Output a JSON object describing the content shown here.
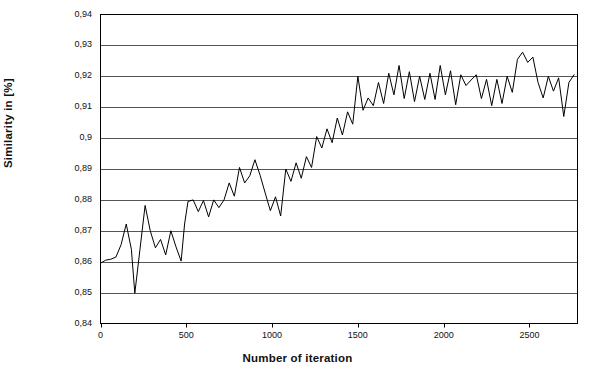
{
  "chart_data": {
    "type": "line",
    "title": "",
    "xlabel": "Number of iteration",
    "ylabel": "Similarity in [%]",
    "xlim": [
      0,
      2780
    ],
    "ylim": [
      0.84,
      0.94
    ],
    "grid": "horizontal",
    "legend": "none",
    "line_color": "#000000",
    "y_tick_labels": [
      "0,94",
      "0,93",
      "0,92",
      "0,91",
      "0,9",
      "0,89",
      "0,88",
      "0,87",
      "0,86",
      "0,85",
      "0,84"
    ],
    "y_tick_values": [
      0.94,
      0.93,
      0.92,
      0.91,
      0.9,
      0.89,
      0.88,
      0.87,
      0.86,
      0.85,
      0.84
    ],
    "x_tick_labels": [
      "0",
      "500",
      "1000",
      "1500",
      "2000",
      "2500"
    ],
    "x_tick_values": [
      0,
      500,
      1000,
      1500,
      2000,
      2500
    ],
    "series": [
      {
        "name": "similarity",
        "x": [
          0,
          30,
          60,
          90,
          120,
          150,
          180,
          200,
          230,
          260,
          290,
          320,
          350,
          380,
          410,
          440,
          470,
          490,
          510,
          540,
          570,
          600,
          630,
          660,
          690,
          720,
          750,
          780,
          810,
          840,
          870,
          900,
          930,
          960,
          990,
          1020,
          1050,
          1080,
          1110,
          1140,
          1170,
          1200,
          1230,
          1260,
          1290,
          1320,
          1350,
          1380,
          1410,
          1440,
          1470,
          1500,
          1530,
          1560,
          1590,
          1620,
          1650,
          1680,
          1710,
          1740,
          1770,
          1800,
          1830,
          1860,
          1890,
          1920,
          1950,
          1980,
          2010,
          2040,
          2070,
          2100,
          2130,
          2160,
          2190,
          2220,
          2250,
          2280,
          2310,
          2340,
          2370,
          2400,
          2430,
          2460,
          2490,
          2520,
          2550,
          2580,
          2610,
          2640,
          2670,
          2700,
          2730,
          2760
        ],
        "y": [
          0.8595,
          0.8605,
          0.8608,
          0.8615,
          0.8655,
          0.8722,
          0.864,
          0.8498,
          0.864,
          0.8782,
          0.87,
          0.8645,
          0.8672,
          0.8622,
          0.87,
          0.8648,
          0.8602,
          0.8722,
          0.8795,
          0.88,
          0.8762,
          0.8798,
          0.8745,
          0.88,
          0.8775,
          0.88,
          0.8855,
          0.8812,
          0.8905,
          0.8855,
          0.8878,
          0.893,
          0.888,
          0.8822,
          0.8765,
          0.881,
          0.8748,
          0.89,
          0.886,
          0.892,
          0.887,
          0.894,
          0.8905,
          0.9005,
          0.8968,
          0.903,
          0.8985,
          0.9065,
          0.901,
          0.9085,
          0.9045,
          0.92,
          0.909,
          0.913,
          0.9105,
          0.918,
          0.9112,
          0.921,
          0.914,
          0.9235,
          0.9128,
          0.9215,
          0.9118,
          0.92,
          0.9125,
          0.921,
          0.9125,
          0.9235,
          0.914,
          0.9218,
          0.9108,
          0.9205,
          0.917,
          0.9188,
          0.9205,
          0.9128,
          0.919,
          0.9105,
          0.919,
          0.9112,
          0.92,
          0.9148,
          0.9255,
          0.9278,
          0.9245,
          0.9262,
          0.918,
          0.913,
          0.92,
          0.9152,
          0.9195,
          0.907,
          0.918,
          0.9205
        ]
      }
    ]
  }
}
